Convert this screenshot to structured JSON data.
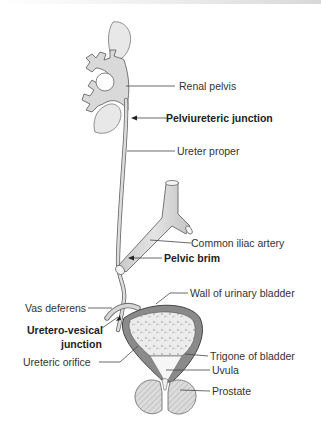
{
  "diagram": {
    "type": "anatomical illustration",
    "labels": {
      "renal_pelvis": "Renal pelvis",
      "pelviureteric_junction": "Pelviureteric junction",
      "ureter_proper": "Ureter proper",
      "common_iliac_artery": "Common iliac artery",
      "pelvic_brim": "Pelvic brim",
      "vas_deferens": "Vas deferens",
      "wall_of_urinary_bladder": "Wall of urinary bladder",
      "uretero_vesical_junction_1": "Uretero-vesical",
      "uretero_vesical_junction_2": "junction",
      "ureteric_orifice": "Ureteric orifice",
      "trigone_of_bladder": "Trigone of bladder",
      "uvula": "Uvula",
      "prostate": "Prostate"
    },
    "emphasized_labels": [
      "Pelviureteric junction",
      "Pelvic brim",
      "Uretero-vesical junction"
    ],
    "colors": {
      "structure_fill": "#d9d9d9",
      "outline": "#555555",
      "bladder_wall": "#7a7a7a",
      "leader_line": "#444444"
    }
  }
}
